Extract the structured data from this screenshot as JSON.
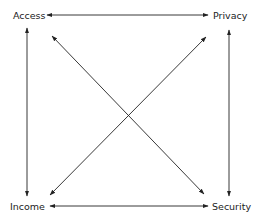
{
  "diagram": {
    "type": "concept-relationship",
    "nodes": [
      {
        "id": "access",
        "label": "Access",
        "position": "top-left"
      },
      {
        "id": "privacy",
        "label": "Privacy",
        "position": "top-right"
      },
      {
        "id": "income",
        "label": "Income",
        "position": "bottom-left"
      },
      {
        "id": "security",
        "label": "Security",
        "position": "bottom-right"
      }
    ],
    "edges": [
      {
        "from": "access",
        "to": "privacy",
        "direction": "bidirectional"
      },
      {
        "from": "income",
        "to": "security",
        "direction": "bidirectional"
      },
      {
        "from": "access",
        "to": "income",
        "direction": "bidirectional"
      },
      {
        "from": "privacy",
        "to": "security",
        "direction": "bidirectional"
      },
      {
        "from": "access",
        "to": "security",
        "direction": "bidirectional"
      },
      {
        "from": "privacy",
        "to": "income",
        "direction": "bidirectional"
      }
    ],
    "colors": {
      "line": "#222222",
      "text": "#222222",
      "background": "#ffffff"
    }
  }
}
